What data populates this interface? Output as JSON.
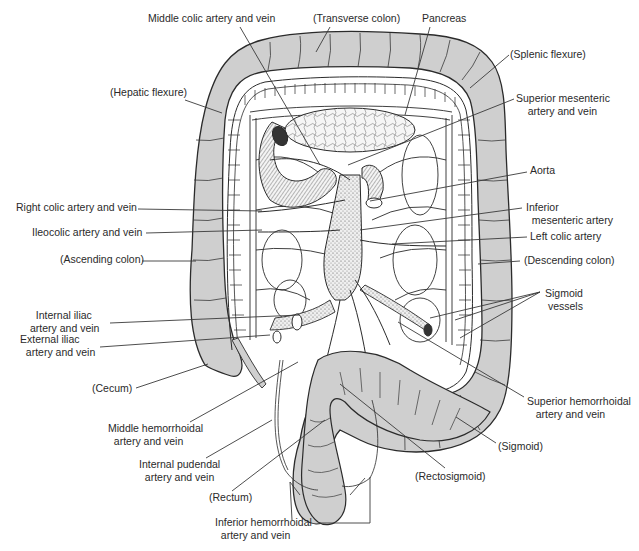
{
  "diagram": {
    "colors": {
      "colon_fill": "#cfcfcf",
      "outline": "#2b2b2b",
      "vessel_fill": "#ffffff",
      "label_text": "#2a2a2a",
      "leader_line": "#3a3a3a",
      "background": "#ffffff"
    }
  },
  "labels": [
    {
      "id": "middle-colic",
      "text": "Middle colic artery and vein",
      "x": 148,
      "y": 12,
      "align": "l",
      "leader": [
        [
          240,
          27
        ],
        [
          320,
          165
        ]
      ]
    },
    {
      "id": "transverse-colon",
      "text": "(Transverse colon)",
      "x": 313,
      "y": 12,
      "align": "l",
      "leader": [
        [
          330,
          27
        ],
        [
          316,
          52
        ]
      ]
    },
    {
      "id": "pancreas",
      "text": "Pancreas",
      "x": 422,
      "y": 12,
      "align": "l",
      "leader": [
        [
          430,
          27
        ],
        [
          405,
          115
        ]
      ]
    },
    {
      "id": "splenic-flexure",
      "text": "(Splenic flexure)",
      "x": 510,
      "y": 48,
      "align": "l",
      "leader": [
        [
          509,
          55
        ],
        [
          470,
          88
        ]
      ]
    },
    {
      "id": "superior-mesenteric",
      "text": "Superior mesenteric\n    artery and vein",
      "x": 516,
      "y": 92,
      "align": "l",
      "leader": [
        [
          514,
          99
        ],
        [
          348,
          165
        ]
      ]
    },
    {
      "id": "hepatic-flexure",
      "text": "(Hepatic flexure)",
      "x": 110,
      "y": 86,
      "align": "l",
      "leader": [
        [
          185,
          100
        ],
        [
          222,
          113
        ]
      ]
    },
    {
      "id": "aorta",
      "text": "Aorta",
      "x": 530,
      "y": 164,
      "align": "l",
      "leader": [
        [
          527,
          172
        ],
        [
          370,
          201
        ]
      ]
    },
    {
      "id": "right-colic",
      "text": "Right colic artery and vein",
      "x": 16,
      "y": 201,
      "align": "l",
      "leader": [
        [
          138,
          209
        ],
        [
          262,
          211
        ]
      ]
    },
    {
      "id": "inferior-mesenteric",
      "text": "Inferior\n  mesenteric artery",
      "x": 526,
      "y": 201,
      "align": "l",
      "leader": [
        [
          522,
          208
        ],
        [
          360,
          230
        ]
      ]
    },
    {
      "id": "ileocolic",
      "text": "Ileocolic artery and vein",
      "x": 32,
      "y": 226,
      "align": "l",
      "leader": [
        [
          146,
          233
        ],
        [
          262,
          230
        ]
      ]
    },
    {
      "id": "left-colic",
      "text": "Left colic artery",
      "x": 530,
      "y": 230,
      "align": "l",
      "leader": [
        [
          527,
          237
        ],
        [
          392,
          244
        ]
      ]
    },
    {
      "id": "ascending-colon",
      "text": "(Ascending colon)",
      "x": 60,
      "y": 253,
      "align": "l",
      "leader": [
        [
          142,
          261
        ],
        [
          196,
          261
        ]
      ]
    },
    {
      "id": "descending-colon",
      "text": "(Descending colon)",
      "x": 524,
      "y": 254,
      "align": "l",
      "leader": [
        [
          520,
          261
        ],
        [
          478,
          264
        ]
      ]
    },
    {
      "id": "sigmoid-vessels",
      "text": "Sigmoid\n vessels",
      "x": 545,
      "y": 287,
      "align": "l",
      "leader": [
        [
          540,
          292
        ],
        [
          430,
          318
        ]
      ],
      "leader2": [
        [
          540,
          292
        ],
        [
          455,
          320
        ]
      ],
      "leader3": [
        [
          540,
          292
        ],
        [
          460,
          338
        ]
      ]
    },
    {
      "id": "internal-iliac",
      "text": "  Internal iliac\nartery and vein",
      "x": 30,
      "y": 309,
      "align": "l",
      "leader": [
        [
          110,
          323
        ],
        [
          300,
          315
        ]
      ]
    },
    {
      "id": "external-iliac",
      "text": "External iliac\n  artery and vein",
      "x": 20,
      "y": 333,
      "align": "l",
      "leader": [
        [
          100,
          347
        ],
        [
          270,
          335
        ]
      ]
    },
    {
      "id": "cecum",
      "text": "(Cecum)",
      "x": 92,
      "y": 382,
      "align": "l",
      "leader": [
        [
          136,
          388
        ],
        [
          208,
          364
        ]
      ]
    },
    {
      "id": "superior-hemorrhoidal",
      "text": "Superior hemorrhoidal\n   artery and vein",
      "x": 527,
      "y": 395,
      "align": "l",
      "leader": [
        [
          524,
          397
        ],
        [
          398,
          322
        ]
      ]
    },
    {
      "id": "middle-hemorrhoidal",
      "text": "Middle hemorrhoidal\n  artery and vein",
      "x": 108,
      "y": 422,
      "align": "l",
      "leader": [
        [
          190,
          422
        ],
        [
          298,
          362
        ]
      ]
    },
    {
      "id": "sigmoid",
      "text": "(Sigmoid)",
      "x": 498,
      "y": 440,
      "align": "l",
      "leader": [
        [
          496,
          443
        ],
        [
          456,
          417
        ]
      ]
    },
    {
      "id": "internal-pudendal",
      "text": "Internal pudendal\n  artery and vein",
      "x": 139,
      "y": 458,
      "align": "l",
      "leader": [
        [
          206,
          458
        ],
        [
          272,
          420
        ]
      ]
    },
    {
      "id": "rectosigmoid",
      "text": "(Rectosigmoid)",
      "x": 415,
      "y": 470,
      "align": "l",
      "leader": [
        [
          445,
          468
        ],
        [
          340,
          384
        ]
      ]
    },
    {
      "id": "rectum",
      "text": "(Rectum)",
      "x": 209,
      "y": 491,
      "align": "l",
      "leader": [
        [
          232,
          491
        ],
        [
          325,
          420
        ]
      ]
    },
    {
      "id": "inferior-hemorrhoidal",
      "text": "Inferior hemorrhoidal\n  artery and vein",
      "x": 215,
      "y": 516,
      "align": "l",
      "leader": [
        [
          290,
          482
        ],
        [
          292,
          520
        ]
      ],
      "leader2": [
        [
          320,
          523
        ],
        [
          370,
          523
        ]
      ],
      "leader3": [
        [
          370,
          523
        ],
        [
          370,
          477
        ]
      ]
    }
  ]
}
